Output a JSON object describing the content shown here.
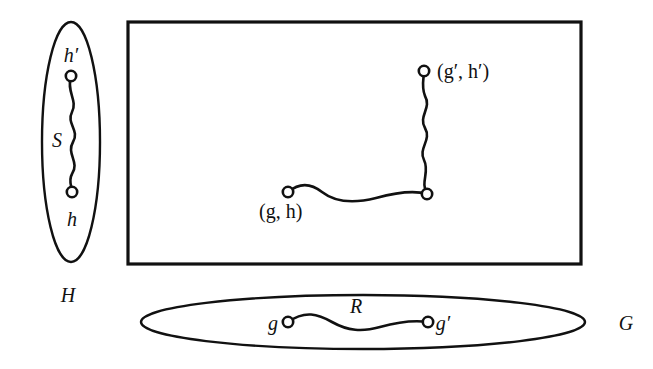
{
  "figure": {
    "background_color": "#ffffff",
    "ink_color": "#111111"
  },
  "vertical_set": {
    "name": "set-h",
    "label": "H",
    "shape": "ellipse",
    "center_x": 71,
    "center_y": 142,
    "rx": 29,
    "ry": 120,
    "label_x": 68,
    "label_y": 302,
    "nodes": [
      {
        "id": "h-prime",
        "label": "h′",
        "x": 71,
        "y": 76,
        "label_x": 71,
        "label_y": 62
      },
      {
        "id": "h",
        "label": "h",
        "x": 72,
        "y": 192,
        "label_x": 72,
        "label_y": 226
      }
    ],
    "path": {
      "name": "path-s",
      "label": "S",
      "label_x": 57,
      "label_y": 147,
      "d": "M 71 76 C 66 92 78 100 72 112 C 66 124 80 130 73 142 C 66 154 80 162 72 174 C 68 181 72 186 72 192"
    }
  },
  "horizontal_set": {
    "name": "set-g",
    "label": "G",
    "shape": "ellipse",
    "center_x": 363,
    "center_y": 322,
    "rx": 222,
    "ry": 27,
    "label_x": 626,
    "label_y": 330,
    "nodes": [
      {
        "id": "g",
        "label": "g",
        "x": 288,
        "y": 322,
        "label_x": 273,
        "label_y": 330
      },
      {
        "id": "g-prime",
        "label": "g′",
        "x": 428,
        "y": 322,
        "label_x": 443,
        "label_y": 330
      }
    ],
    "path": {
      "name": "path-r",
      "label": "R",
      "label_x": 356,
      "label_y": 313,
      "d": "M 288 322 C 305 310 318 314 332 322 C 348 331 362 332 380 327 C 398 322 414 320 428 322"
    }
  },
  "product_region": {
    "name": "product-rectangle",
    "shape": "rectangle",
    "x": 128,
    "y": 22,
    "width": 453,
    "height": 242,
    "nodes": [
      {
        "id": "gh",
        "label": "(g, h)",
        "x": 288,
        "y": 192,
        "label_x": 259,
        "label_y": 218
      },
      {
        "id": "corner",
        "label": "",
        "x": 427,
        "y": 194,
        "label_x": 0,
        "label_y": 0
      },
      {
        "id": "gh-prime",
        "label": "(g′, h′)",
        "x": 424,
        "y": 71,
        "label_x": 437,
        "label_y": 78
      }
    ],
    "paths": [
      {
        "name": "product-path-horizontal",
        "d": "M 288 192 C 300 182 312 184 322 192 C 336 203 356 203 376 198 C 398 192 414 190 427 194"
      },
      {
        "name": "product-path-vertical",
        "d": "M 427 194 C 420 182 430 172 424 160 C 418 148 432 140 425 128 C 418 116 432 108 425 96 C 421 86 424 78 424 71"
      }
    ]
  },
  "stroke_widths": {
    "rectangle": 3.2,
    "ellipse": 2.4,
    "path": 2.6,
    "node_radius": 5.2
  }
}
